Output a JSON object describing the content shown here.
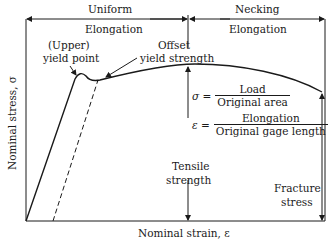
{
  "diagram": {
    "regions": [
      {
        "label": "Uniform",
        "sublabel": "Elongation"
      },
      {
        "label": "Necking",
        "sublabel": "Elongation"
      }
    ],
    "annotations": {
      "upper_yield_line1": "(Upper)",
      "upper_yield_line2": "yield point",
      "offset_line1": "Offset",
      "offset_line2": "yield strength",
      "tensile_line1": "Tensile",
      "tensile_line2": "strength",
      "fracture_line1": "Fracture",
      "fracture_line2": "stress"
    },
    "equations": {
      "stress": {
        "symbol": "σ =",
        "numerator": "Load",
        "denominator": "Original area"
      },
      "strain": {
        "symbol": "ε =",
        "numerator": "Elongation",
        "denominator": "Original gage length"
      }
    },
    "axes": {
      "xlabel": "Nominal strain, ε",
      "ylabel": "Nominal stress, σ"
    },
    "colors": {
      "line": "#1a1a1a",
      "background": "#ffffff"
    }
  }
}
